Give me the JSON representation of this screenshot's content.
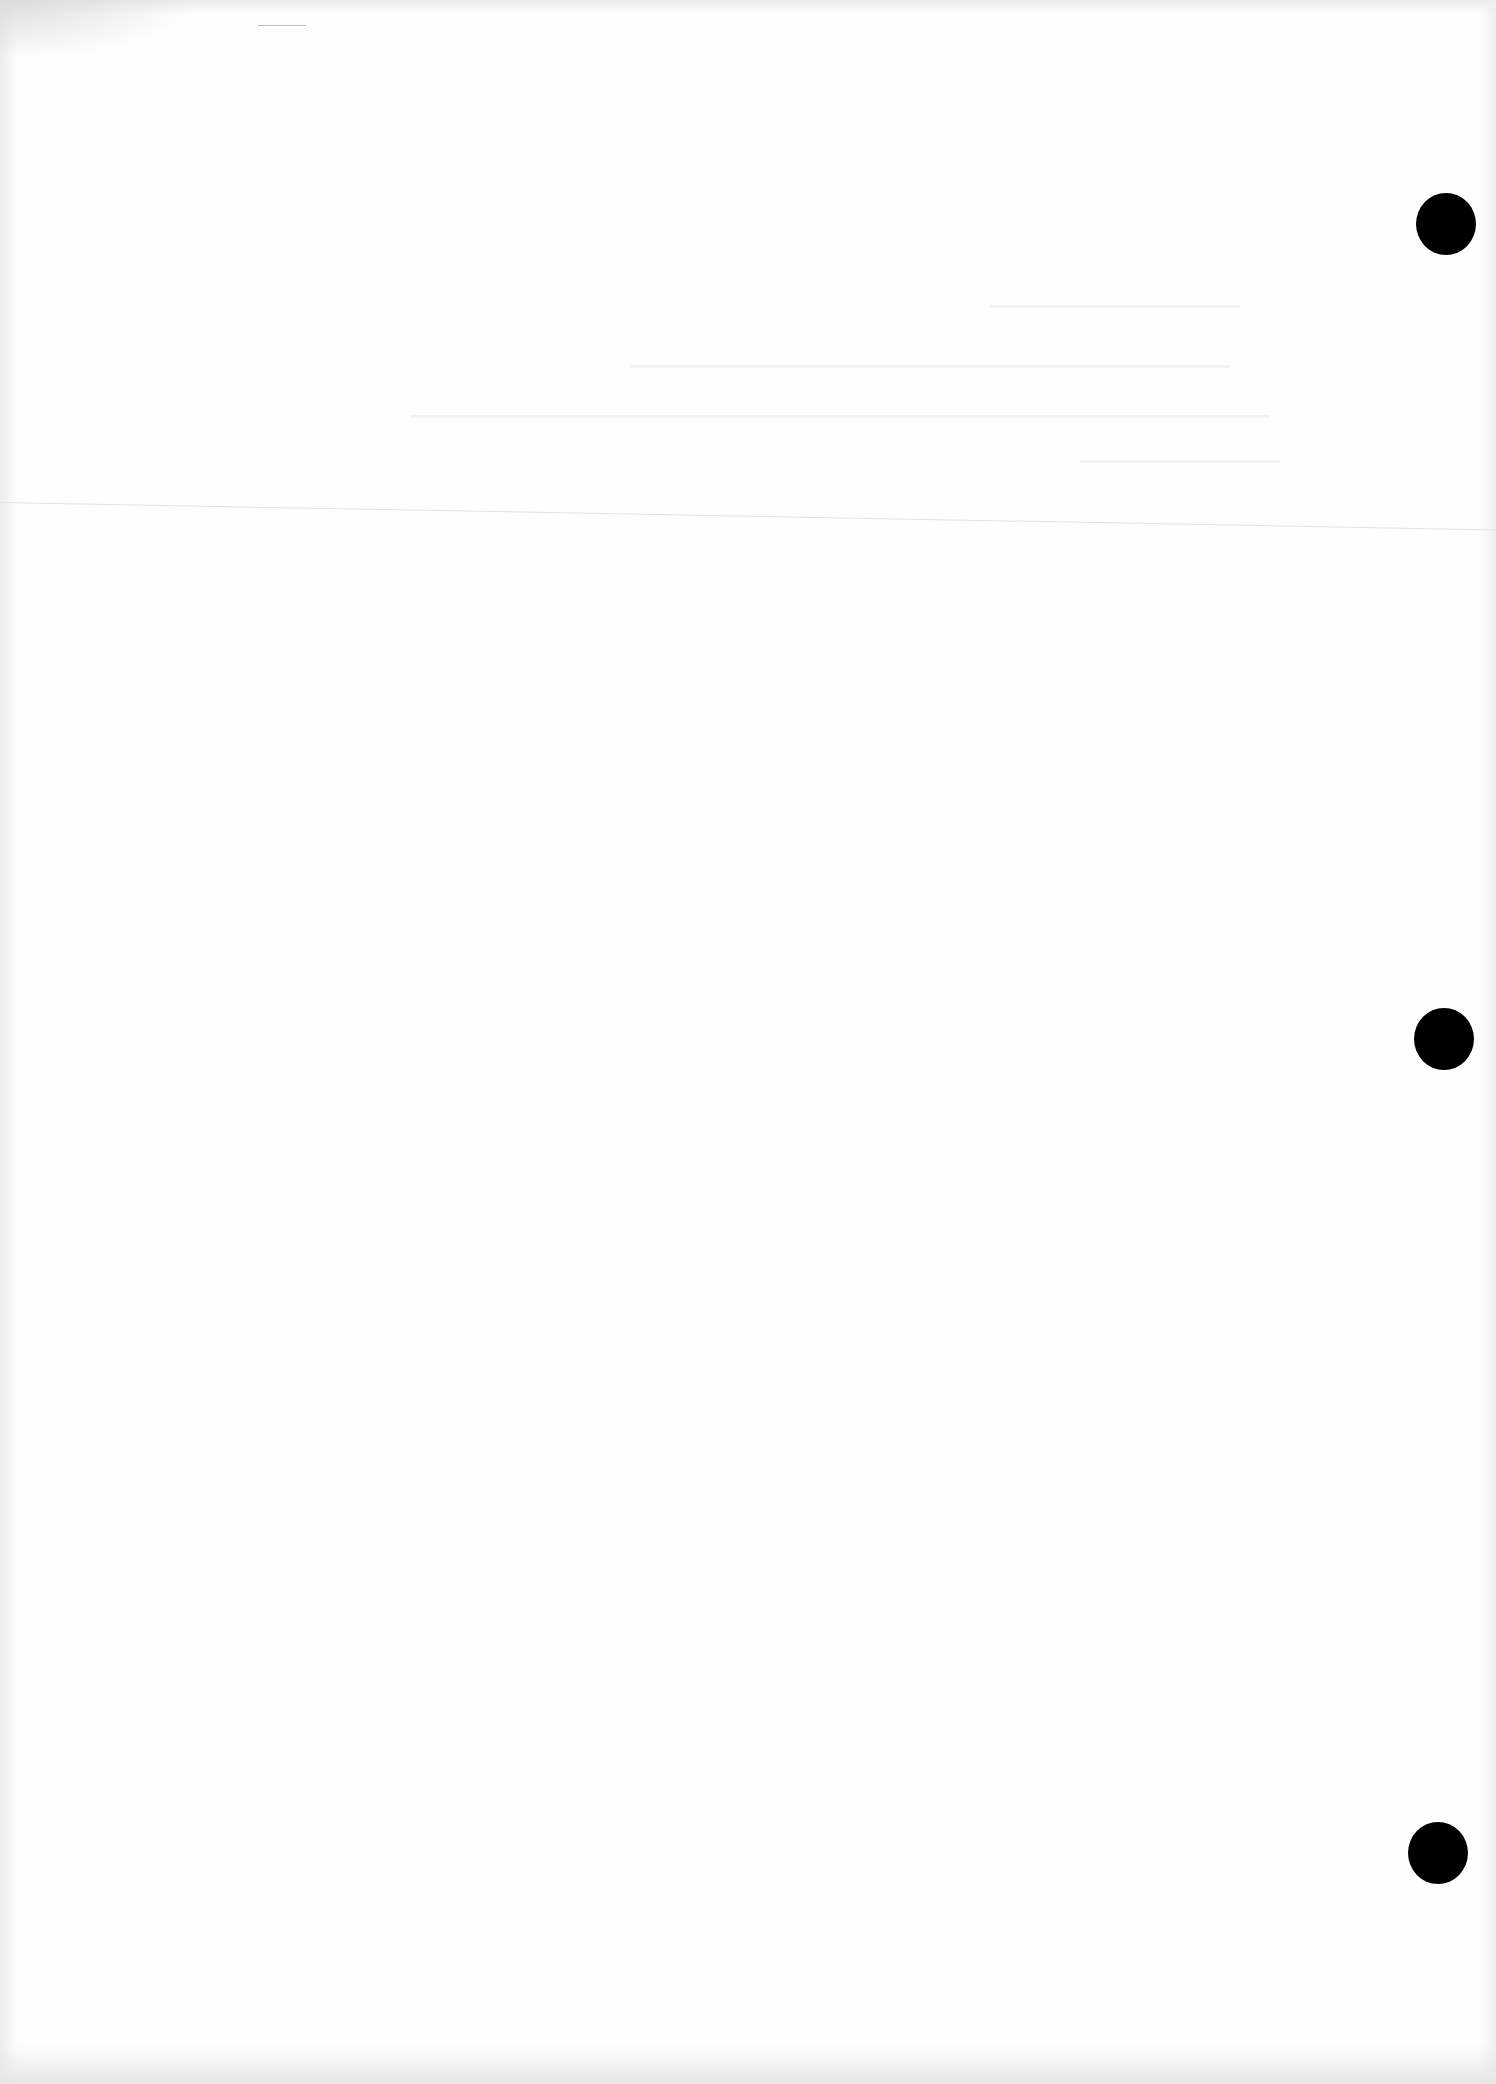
{
  "document": {
    "type": "scanned-blank-page",
    "background_color": "#fefefe",
    "text_content": "",
    "punch_holes": [
      {
        "x": 1416,
        "y": 193,
        "color": "#000000"
      },
      {
        "x": 1414,
        "y": 1008,
        "color": "#000000"
      },
      {
        "x": 1408,
        "y": 1822,
        "color": "#000000"
      }
    ],
    "fold_line": {
      "y_start": 502,
      "y_end": 545,
      "color": "#e2e2e2"
    }
  }
}
